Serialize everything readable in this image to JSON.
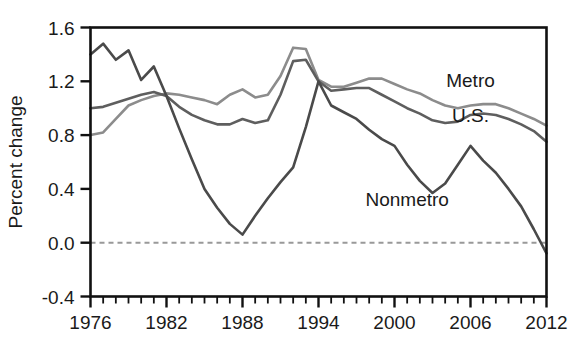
{
  "chart_data": {
    "type": "line",
    "title": "",
    "xlabel": "",
    "ylabel": "Percent change",
    "xlim": [
      1976,
      2012
    ],
    "ylim": [
      -0.4,
      1.6
    ],
    "grid": false,
    "legend_position": "inline-annotations",
    "zero_reference_line": {
      "value": 0.0,
      "style": "dashed",
      "color": "#999999"
    },
    "x_tick_labels": [
      "1976",
      "1982",
      "1988",
      "1994",
      "2000",
      "2006",
      "2012"
    ],
    "x_tick_values": [
      1976,
      1982,
      1988,
      1994,
      2000,
      2006,
      2012
    ],
    "x_minor_tick_interval": 1,
    "y_tick_labels": [
      "1.6",
      "1.2",
      "0.8",
      "0.4",
      "0.0",
      "-0.4"
    ],
    "y_tick_values": [
      1.6,
      1.2,
      0.8,
      0.4,
      0.0,
      -0.4
    ],
    "x": [
      1976,
      1977,
      1978,
      1979,
      1980,
      1981,
      1982,
      1983,
      1984,
      1985,
      1986,
      1987,
      1988,
      1989,
      1990,
      1991,
      1992,
      1993,
      1994,
      1995,
      1996,
      1997,
      1998,
      1999,
      2000,
      2001,
      2002,
      2003,
      2004,
      2005,
      2006,
      2007,
      2008,
      2009,
      2010,
      2011,
      2012
    ],
    "series": [
      {
        "name": "Metro",
        "color": "#8c8c8c",
        "label_x": 2006,
        "label_y": 1.16,
        "values": [
          0.8,
          0.82,
          0.92,
          1.02,
          1.06,
          1.09,
          1.11,
          1.1,
          1.08,
          1.06,
          1.03,
          1.1,
          1.14,
          1.08,
          1.1,
          1.24,
          1.45,
          1.44,
          1.21,
          1.16,
          1.16,
          1.19,
          1.22,
          1.22,
          1.18,
          1.14,
          1.11,
          1.06,
          1.02,
          1.0,
          1.02,
          1.03,
          1.03,
          1.0,
          0.96,
          0.92,
          0.87
        ]
      },
      {
        "name": "U.S.",
        "color": "#5e5e5e",
        "label_x": 2006,
        "label_y": 0.9,
        "values": [
          1.0,
          1.01,
          1.04,
          1.07,
          1.1,
          1.12,
          1.09,
          1.01,
          0.95,
          0.91,
          0.88,
          0.88,
          0.92,
          0.89,
          0.91,
          1.1,
          1.35,
          1.36,
          1.2,
          1.13,
          1.14,
          1.15,
          1.15,
          1.1,
          1.05,
          1.0,
          0.96,
          0.91,
          0.89,
          0.9,
          0.95,
          0.96,
          0.95,
          0.92,
          0.88,
          0.83,
          0.75
        ]
      },
      {
        "name": "Nonmetro",
        "color": "#4a4a4a",
        "label_x": 2001,
        "label_y": 0.27,
        "values": [
          1.4,
          1.48,
          1.36,
          1.43,
          1.21,
          1.31,
          1.09,
          0.85,
          0.62,
          0.4,
          0.26,
          0.14,
          0.06,
          0.2,
          0.33,
          0.45,
          0.56,
          0.86,
          1.2,
          1.02,
          0.97,
          0.92,
          0.84,
          0.77,
          0.72,
          0.58,
          0.46,
          0.37,
          0.44,
          0.58,
          0.72,
          0.61,
          0.52,
          0.4,
          0.27,
          0.1,
          -0.08
        ]
      }
    ]
  },
  "axis": {
    "y_title": "Percent change"
  }
}
